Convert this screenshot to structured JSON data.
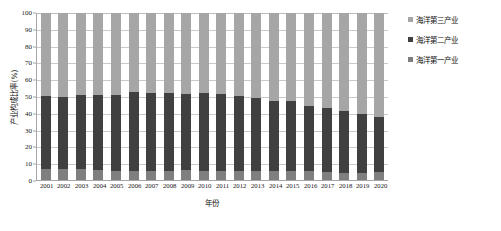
{
  "chart_data": {
    "type": "bar",
    "subtype": "100% stacked column",
    "title": "",
    "xlabel": "年份",
    "ylabel": "产业构成比率(%)",
    "ylim": [
      0,
      100
    ],
    "ytick_step": 10,
    "grid": true,
    "legend_position": "right",
    "categories": [
      "2001",
      "2002",
      "2003",
      "2004",
      "2005",
      "2006",
      "2007",
      "2008",
      "2009",
      "2010",
      "2011",
      "2012",
      "2013",
      "2014",
      "2015",
      "2016",
      "2017",
      "2018",
      "2019",
      "2020"
    ],
    "yticks": [
      "0",
      "10",
      "20",
      "30",
      "40",
      "50",
      "60",
      "70",
      "80",
      "90",
      "100"
    ],
    "series": [
      {
        "name": "海洋第一产业",
        "color": "#7f7f7f",
        "values": [
          6.8,
          6.4,
          6.5,
          6.0,
          5.7,
          5.5,
          5.2,
          5.3,
          5.8,
          5.2,
          5.4,
          5.3,
          5.4,
          5.4,
          5.2,
          5.1,
          4.7,
          4.5,
          4.3,
          4.8
        ]
      },
      {
        "name": "海洋第二产业",
        "color": "#404040",
        "values": [
          43.6,
          43.4,
          44.4,
          45.1,
          45.5,
          47.0,
          47.0,
          47.0,
          46.0,
          47.0,
          46.0,
          45.0,
          43.5,
          42.0,
          42.0,
          39.5,
          38.6,
          37.0,
          35.0,
          33.0
        ]
      },
      {
        "name": "海洋第三产业",
        "color": "#a6a6a6",
        "values": [
          49.6,
          50.2,
          49.1,
          48.9,
          48.8,
          47.5,
          47.8,
          47.7,
          48.2,
          47.8,
          48.6,
          49.7,
          51.1,
          52.6,
          52.8,
          55.4,
          56.7,
          58.5,
          60.7,
          62.2
        ]
      }
    ]
  },
  "legend": {
    "items": [
      {
        "label": "海洋第三产业",
        "color": "#a6a6a6"
      },
      {
        "label": "海洋第二产业",
        "color": "#404040"
      },
      {
        "label": "海洋第一产业",
        "color": "#7f7f7f"
      }
    ]
  },
  "axes": {
    "y_title": "产业构成比率(%)",
    "x_title": "年份"
  }
}
